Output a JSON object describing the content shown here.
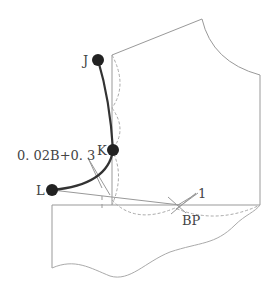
{
  "labels": {
    "J": "J",
    "K": "K",
    "L": "L",
    "formula": "0. 02B+0. 3",
    "one": "1",
    "bp": "BP"
  },
  "colors": {
    "line": "#999999",
    "bold_curve": "#333333",
    "point": "#222222",
    "dashed": "#aaaaaa"
  }
}
